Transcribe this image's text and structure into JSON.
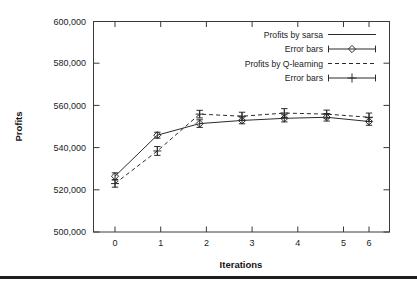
{
  "chart_data": {
    "type": "line",
    "title": "",
    "xlabel": "Iterations",
    "ylabel": "Profits",
    "x": [
      0,
      1,
      2,
      3,
      4,
      5,
      6
    ],
    "xlim": [
      -0.35,
      6.35
    ],
    "ylim": [
      500000,
      600000
    ],
    "xticks": [
      "0",
      "1",
      "2",
      "3",
      "4",
      "5",
      "6"
    ],
    "yticks": [
      "500,000",
      "520,000",
      "540,000",
      "560,000",
      "580,000",
      "600,000"
    ],
    "ytick_values": [
      500000,
      520000,
      540000,
      560000,
      580000,
      600000
    ],
    "grid": false,
    "legend_position": "top-right",
    "series": [
      {
        "name": "Profits by sarsa",
        "style": "solid",
        "marker": "none",
        "values": [
          526500,
          546000,
          551500,
          553000,
          554000,
          554500,
          552500
        ]
      },
      {
        "name": "Error bars",
        "style": "errorbar",
        "marker": "diamond",
        "values": [
          526500,
          546000,
          551500,
          553000,
          554000,
          554500,
          552500
        ],
        "err_low": [
          1600,
          1400,
          1800,
          1600,
          1700,
          1800,
          1800
        ],
        "err_high": [
          1600,
          1400,
          1800,
          1600,
          1700,
          1800,
          1800
        ]
      },
      {
        "name": "Profits by Q-learning",
        "style": "dashed",
        "marker": "none",
        "values": [
          523000,
          538500,
          556000,
          555000,
          556500,
          556000,
          554500
        ]
      },
      {
        "name": "Error bars",
        "style": "errorbar",
        "marker": "plus",
        "values": [
          523000,
          538500,
          556000,
          555000,
          556500,
          556000,
          554500
        ],
        "err_low": [
          1700,
          2100,
          1800,
          1900,
          2100,
          1900,
          2000
        ],
        "err_high": [
          1700,
          2100,
          1800,
          1900,
          2100,
          1900,
          2000
        ]
      }
    ],
    "legend": [
      {
        "label": "Profits by sarsa",
        "key": "solid-line"
      },
      {
        "label": "Error bars",
        "key": "diamond-errorbar"
      },
      {
        "label": "Profits by Q-learning",
        "key": "dashed-line"
      },
      {
        "label": "Error bars",
        "key": "plus-errorbar"
      }
    ],
    "colors": {
      "line": "#2b2b2b",
      "frame": "#3a3a3a",
      "text": "#1c1c1c",
      "background": "#ffffff"
    }
  }
}
